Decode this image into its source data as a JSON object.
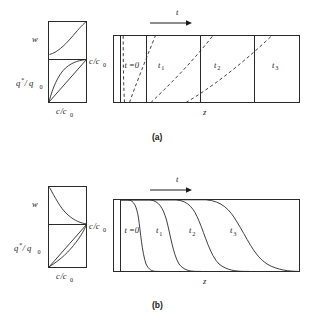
{
  "figure": {
    "title_tags": [
      "(a)",
      "(b)"
    ],
    "caption": "",
    "axis_labels": {
      "w": "w",
      "q_ratio_main": "q",
      "q_ratio_star": "*",
      "q_ratio_denom": "/ q",
      "q_ratio_sub": "0",
      "c_ratio_main": "c",
      "c_ratio_slash": "/c",
      "c_ratio_sub": "0",
      "z": "z",
      "t": "t"
    },
    "time_labels": [
      {
        "text": "t =0",
        "sub": ""
      },
      {
        "text": "t",
        "sub": "1"
      },
      {
        "text": "t",
        "sub": "2"
      },
      {
        "text": "t",
        "sub": "3"
      }
    ]
  },
  "panel_a": {
    "tag": "(a)",
    "arrow_label": "t",
    "side_plot": {
      "top_ylabel": "w",
      "bottom_ylabel_parts": [
        "q",
        "*",
        "/ q",
        "0"
      ],
      "xlabel_parts": [
        "c",
        "/c",
        "0"
      ],
      "right_label_parts": [
        "c",
        "/c",
        "0"
      ],
      "top_curve_shape": "concave-increasing",
      "bottom_curve_shape": "concave-above-diagonal",
      "diagonal": true
    },
    "main_plot": {
      "xlabel": "z",
      "curve_style": "dashed",
      "curve_shape": "self-sharpening-slanted",
      "time_labels": [
        "t =0",
        "t1",
        "t2",
        "t3"
      ],
      "dividers": 3
    }
  },
  "panel_b": {
    "tag": "(b)",
    "arrow_label": "t",
    "side_plot": {
      "top_ylabel": "w",
      "bottom_ylabel_parts": [
        "q",
        "*",
        "/ q",
        "0"
      ],
      "xlabel_parts": [
        "c",
        "/c",
        "0"
      ],
      "right_label_parts": [
        "c",
        "/c",
        "0"
      ],
      "top_curve_shape": "convex-decreasing",
      "bottom_curve_shape": "convex-below-diagonal",
      "diagonal": true
    },
    "main_plot": {
      "xlabel": "z",
      "curve_style": "solid",
      "curve_shape": "spreading-sigmoid",
      "time_labels": [
        "t =0",
        "t1",
        "t2",
        "t3"
      ],
      "dividers": 0
    }
  },
  "colors": {
    "ink": "#1a1a1a",
    "line": "#2a2a2a",
    "background": "#ffffff",
    "caption_gray": "#8d8d8d"
  }
}
